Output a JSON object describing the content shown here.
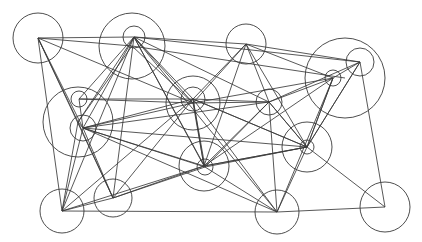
{
  "figure": {
    "type": "graph",
    "width": 422,
    "height": 242,
    "background_color": "#ffffff",
    "stroke_color": "#3a3a3a",
    "node_fill": "none",
    "edge_count": 78,
    "node_count": 21
  },
  "chart_data": {
    "type": "graph",
    "title": "",
    "xlabel": "",
    "ylabel": "",
    "grid": false,
    "legend": "none",
    "directed": false,
    "node_shape": "circle",
    "node_style": "outline",
    "edge_style": "straight-line",
    "nodes": [
      {
        "id": "n0",
        "label": "",
        "x": 38,
        "y": 38,
        "r": 25
      },
      {
        "id": "n1",
        "label": "",
        "x": 132,
        "y": 46,
        "r": 33
      },
      {
        "id": "n2",
        "label": "",
        "x": 134,
        "y": 37,
        "r": 11
      },
      {
        "id": "n3",
        "label": "",
        "x": 246,
        "y": 44,
        "r": 20
      },
      {
        "id": "n4",
        "label": "",
        "x": 345,
        "y": 78,
        "r": 40
      },
      {
        "id": "n5",
        "label": "",
        "x": 360,
        "y": 62,
        "r": 14
      },
      {
        "id": "n6",
        "label": "",
        "x": 333,
        "y": 78,
        "r": 8
      },
      {
        "id": "n7",
        "label": "",
        "x": 78,
        "y": 122,
        "r": 35
      },
      {
        "id": "n8",
        "label": "",
        "x": 79,
        "y": 99,
        "r": 8
      },
      {
        "id": "n9",
        "label": "",
        "x": 83,
        "y": 128,
        "r": 13
      },
      {
        "id": "n10",
        "label": "",
        "x": 193,
        "y": 103,
        "r": 27
      },
      {
        "id": "n11",
        "label": "",
        "x": 193,
        "y": 99,
        "r": 12
      },
      {
        "id": "n12",
        "label": "",
        "x": 269,
        "y": 102,
        "r": 13
      },
      {
        "id": "n13",
        "label": "",
        "x": 307,
        "y": 147,
        "r": 25
      },
      {
        "id": "n14",
        "label": "",
        "x": 307,
        "y": 147,
        "r": 7
      },
      {
        "id": "n15",
        "label": "",
        "x": 204,
        "y": 166,
        "r": 25
      },
      {
        "id": "n16",
        "label": "",
        "x": 205,
        "y": 167,
        "r": 8
      },
      {
        "id": "n17",
        "label": "",
        "x": 62,
        "y": 211,
        "r": 22
      },
      {
        "id": "n18",
        "label": "",
        "x": 113,
        "y": 198,
        "r": 19
      },
      {
        "id": "n19",
        "label": "",
        "x": 277,
        "y": 212,
        "r": 22
      },
      {
        "id": "n20",
        "label": "",
        "x": 385,
        "y": 207,
        "r": 25
      }
    ],
    "edges": [
      {
        "source": "n0",
        "target": "n1"
      },
      {
        "source": "n0",
        "target": "n2"
      },
      {
        "source": "n0",
        "target": "n7"
      },
      {
        "source": "n0",
        "target": "n9"
      },
      {
        "source": "n0",
        "target": "n10"
      },
      {
        "source": "n0",
        "target": "n17"
      },
      {
        "source": "n0",
        "target": "n18"
      },
      {
        "source": "n2",
        "target": "n3"
      },
      {
        "source": "n2",
        "target": "n5"
      },
      {
        "source": "n2",
        "target": "n7"
      },
      {
        "source": "n2",
        "target": "n8"
      },
      {
        "source": "n2",
        "target": "n9"
      },
      {
        "source": "n2",
        "target": "n10"
      },
      {
        "source": "n2",
        "target": "n11"
      },
      {
        "source": "n2",
        "target": "n12"
      },
      {
        "source": "n2",
        "target": "n15"
      },
      {
        "source": "n2",
        "target": "n16"
      },
      {
        "source": "n2",
        "target": "n17"
      },
      {
        "source": "n2",
        "target": "n18"
      },
      {
        "source": "n2",
        "target": "n19"
      },
      {
        "source": "n1",
        "target": "n10"
      },
      {
        "source": "n1",
        "target": "n7"
      },
      {
        "source": "n3",
        "target": "n5"
      },
      {
        "source": "n3",
        "target": "n6"
      },
      {
        "source": "n3",
        "target": "n10"
      },
      {
        "source": "n3",
        "target": "n11"
      },
      {
        "source": "n3",
        "target": "n12"
      },
      {
        "source": "n3",
        "target": "n15"
      },
      {
        "source": "n3",
        "target": "n13"
      },
      {
        "source": "n5",
        "target": "n6"
      },
      {
        "source": "n5",
        "target": "n12"
      },
      {
        "source": "n5",
        "target": "n13"
      },
      {
        "source": "n5",
        "target": "n14"
      },
      {
        "source": "n5",
        "target": "n20"
      },
      {
        "source": "n6",
        "target": "n12"
      },
      {
        "source": "n6",
        "target": "n13"
      },
      {
        "source": "n6",
        "target": "n14"
      },
      {
        "source": "n6",
        "target": "n15"
      },
      {
        "source": "n6",
        "target": "n19"
      },
      {
        "source": "n6",
        "target": "n10"
      },
      {
        "source": "n7",
        "target": "n9"
      },
      {
        "source": "n7",
        "target": "n17"
      },
      {
        "source": "n7",
        "target": "n18"
      },
      {
        "source": "n8",
        "target": "n9"
      },
      {
        "source": "n8",
        "target": "n10"
      },
      {
        "source": "n8",
        "target": "n11"
      },
      {
        "source": "n9",
        "target": "n10"
      },
      {
        "source": "n9",
        "target": "n11"
      },
      {
        "source": "n9",
        "target": "n12"
      },
      {
        "source": "n9",
        "target": "n13"
      },
      {
        "source": "n9",
        "target": "n15"
      },
      {
        "source": "n9",
        "target": "n16"
      },
      {
        "source": "n9",
        "target": "n17"
      },
      {
        "source": "n9",
        "target": "n18"
      },
      {
        "source": "n9",
        "target": "n19"
      },
      {
        "source": "n10",
        "target": "n12"
      },
      {
        "source": "n10",
        "target": "n15"
      },
      {
        "source": "n11",
        "target": "n12"
      },
      {
        "source": "n11",
        "target": "n13"
      },
      {
        "source": "n11",
        "target": "n14"
      },
      {
        "source": "n11",
        "target": "n15"
      },
      {
        "source": "n11",
        "target": "n16"
      },
      {
        "source": "n11",
        "target": "n17"
      },
      {
        "source": "n11",
        "target": "n18"
      },
      {
        "source": "n11",
        "target": "n19"
      },
      {
        "source": "n12",
        "target": "n13"
      },
      {
        "source": "n12",
        "target": "n14"
      },
      {
        "source": "n12",
        "target": "n15"
      },
      {
        "source": "n12",
        "target": "n16"
      },
      {
        "source": "n12",
        "target": "n19"
      },
      {
        "source": "n13",
        "target": "n15"
      },
      {
        "source": "n14",
        "target": "n15"
      },
      {
        "source": "n14",
        "target": "n16"
      },
      {
        "source": "n14",
        "target": "n19"
      },
      {
        "source": "n14",
        "target": "n20"
      },
      {
        "source": "n15",
        "target": "n17"
      },
      {
        "source": "n15",
        "target": "n18"
      },
      {
        "source": "n16",
        "target": "n18"
      },
      {
        "source": "n16",
        "target": "n19"
      },
      {
        "source": "n17",
        "target": "n18"
      },
      {
        "source": "n17",
        "target": "n19"
      },
      {
        "source": "n19",
        "target": "n20"
      },
      {
        "source": "n4",
        "target": "n1"
      }
    ]
  }
}
